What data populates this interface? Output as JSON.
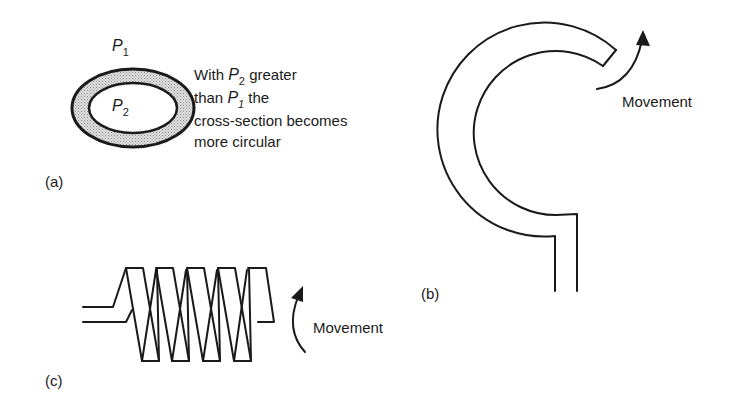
{
  "figure": {
    "panel_a": {
      "label": "(a)",
      "outer_pressure": "P",
      "outer_pressure_sub": "1",
      "inner_pressure": "P",
      "inner_pressure_sub": "2",
      "caption_line1_pre": "With ",
      "caption_line1_var": "P",
      "caption_line1_sub": "2",
      "caption_line1_post": " greater",
      "caption_line2_pre": "than ",
      "caption_line2_var": "P",
      "caption_line2_sub": "1",
      "caption_line2_post": " the",
      "caption_line3": "cross-section becomes",
      "caption_line4": "more circular",
      "ring_fill": "#bdbdbd"
    },
    "panel_b": {
      "label": "(b)",
      "movement_label": "Movement"
    },
    "panel_c": {
      "label": "(c)",
      "movement_label": "Movement"
    }
  }
}
